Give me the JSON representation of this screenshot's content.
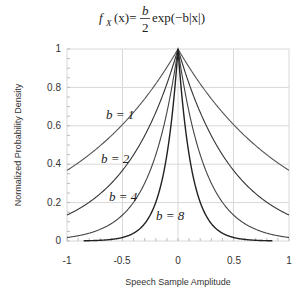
{
  "chart_data": {
    "type": "line",
    "xlabel": "Speech Sample Amplitude",
    "ylabel": "Normalized Probability Density",
    "xlim": [
      -1,
      1
    ],
    "ylim": [
      0,
      1
    ],
    "grid": true,
    "x_ticks": [
      "-1",
      "-0.5",
      "0",
      "0.5",
      "1"
    ],
    "y_ticks": [
      "0",
      "0.2",
      "0.4",
      "0.6",
      "0.8",
      "1"
    ],
    "formula": "normalized: exp(-b|x|)",
    "series": [
      {
        "name": "b=1",
        "b": 1,
        "x": [
          -1,
          -0.5,
          0,
          0.5,
          1
        ],
        "values": [
          0.368,
          0.607,
          1.0,
          0.607,
          0.368
        ]
      },
      {
        "name": "b=2",
        "b": 2,
        "x": [
          -1,
          -0.5,
          0,
          0.5,
          1
        ],
        "values": [
          0.135,
          0.368,
          1.0,
          0.368,
          0.135
        ]
      },
      {
        "name": "b=4",
        "b": 4,
        "x": [
          -1,
          -0.5,
          0,
          0.5,
          1
        ],
        "values": [
          0.018,
          0.135,
          1.0,
          0.135,
          0.018
        ]
      },
      {
        "name": "b=8",
        "b": 8,
        "x": [
          -1,
          -0.5,
          0,
          0.5,
          1
        ],
        "values": [
          0.0003,
          0.018,
          1.0,
          0.018,
          0.0003
        ]
      }
    ],
    "annotations": [
      "b=1",
      "b=2",
      "b=4",
      "b=8"
    ]
  },
  "labels": {
    "formula_lhs": "f",
    "formula_sub": "X",
    "formula_arg": "(x)=",
    "formula_num": "b",
    "formula_den": "2",
    "formula_rhs": "exp(−b|x|)",
    "xlabel": "Speech Sample Amplitude",
    "ylabel": "Normalized Probability Density",
    "b1": "b = 1",
    "b2": "b = 2",
    "b4": "b = 4",
    "b8": "b = 8",
    "xt0": "-1",
    "xt1": "-0.5",
    "xt2": "0",
    "xt3": "0.5",
    "xt4": "1",
    "yt0": "0",
    "yt1": "0.2",
    "yt2": "0.4",
    "yt3": "0.6",
    "yt4": "0.8",
    "yt5": "1"
  }
}
